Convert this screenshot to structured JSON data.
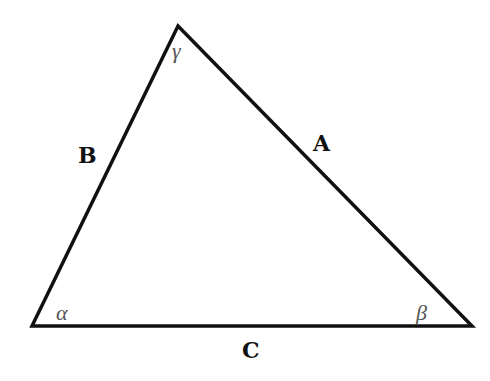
{
  "diagram": {
    "stroke_color": "#111111",
    "background": "#ffffff",
    "vertices": {
      "bottom_left": {
        "x": 32,
        "y": 326
      },
      "bottom_right": {
        "x": 472,
        "y": 326
      },
      "apex": {
        "x": 178,
        "y": 26
      }
    },
    "sides": [
      {
        "name": "A",
        "label": "A",
        "between": "apex-bottom_right"
      },
      {
        "name": "B",
        "label": "B",
        "between": "bottom_left-apex"
      },
      {
        "name": "C",
        "label": "C",
        "between": "bottom_left-bottom_right"
      }
    ],
    "angles": [
      {
        "name": "alpha",
        "label": "α",
        "vertex": "bottom_left"
      },
      {
        "name": "beta",
        "label": "β",
        "vertex": "bottom_right"
      },
      {
        "name": "gamma",
        "label": "γ",
        "vertex": "apex"
      }
    ]
  }
}
